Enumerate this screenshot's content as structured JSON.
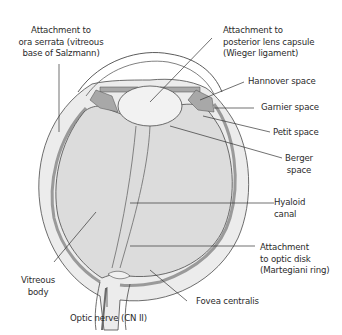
{
  "diagram": {
    "type": "anatomical-cross-section",
    "colors": {
      "background": "#ffffff",
      "vitreous_fill": "#dcdcdc",
      "sclera_fill": "#ececec",
      "choroid_band": "#9a9a9a",
      "lens_fill": "#e6e6e6",
      "ciliary_fill": "#a8a8a8",
      "outline": "#4a4a4a",
      "leader_line": "#333333",
      "text": "#2b2b2b"
    },
    "labels": [
      {
        "id": "ora-serrata",
        "text": "Attachment to\nora serrata (vitreous\nbase of Salzmann)"
      },
      {
        "id": "posterior-lens-capsule",
        "text": "Attachment to\nposterior lens capsule\n(Wieger ligament)"
      },
      {
        "id": "hannover-space",
        "text": "Hannover space"
      },
      {
        "id": "garnier-space",
        "text": "Garnier space"
      },
      {
        "id": "petit-space",
        "text": "Petit space"
      },
      {
        "id": "berger-space",
        "text": "Berger\nspace"
      },
      {
        "id": "hyaloid-canal",
        "text": "Hyaloid\ncanal"
      },
      {
        "id": "optic-disk",
        "text": "Attachment\nto optic disk\n(Martegiani ring)"
      },
      {
        "id": "vitreous-body",
        "text": "Vitreous\nbody"
      },
      {
        "id": "fovea-centralis",
        "text": "Fovea centralis"
      },
      {
        "id": "optic-nerve",
        "text": "Optic nerve (CN II)"
      }
    ]
  }
}
